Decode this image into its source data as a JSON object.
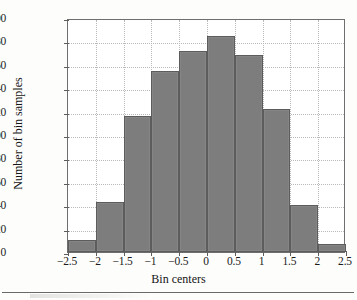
{
  "figure": {
    "background": "#fdfdfc",
    "bar_color": "#7d7d7d",
    "bar_edge_color": "#5c5c5c",
    "grid_color": "#b9b9b9",
    "axis_color": "#6e6e6e"
  },
  "chart_data": {
    "type": "bar",
    "title": "",
    "xlabel": "Bin centers",
    "ylabel": "Number of bin samples",
    "xlim": [
      -2.5,
      2.5
    ],
    "ylim": [
      0,
      200
    ],
    "grid": true,
    "legend": null,
    "bin_width": 0.5,
    "categories": [
      -2.25,
      -1.75,
      -1.25,
      -0.75,
      -0.25,
      0.25,
      0.75,
      1.25,
      1.75,
      2.25
    ],
    "values": [
      10,
      43,
      116,
      155,
      172,
      185,
      168,
      122,
      40,
      7
    ],
    "xticks": [
      -2.5,
      -2,
      -1.5,
      -1,
      -0.5,
      0,
      0.5,
      1,
      1.5,
      2,
      2.5
    ],
    "xticklabels": [
      "−2.5",
      "−2",
      "−1.5",
      "−1",
      "−0.5",
      "0",
      "0.5",
      "1",
      "1.5",
      "2",
      "2.5"
    ],
    "yticks": [
      0,
      20,
      40,
      60,
      80,
      100,
      120,
      140,
      160,
      180,
      200
    ],
    "yticklabels": [
      "0",
      "20",
      "40",
      "60",
      "80",
      "100",
      "120",
      "140",
      "160",
      "180",
      "200"
    ]
  }
}
